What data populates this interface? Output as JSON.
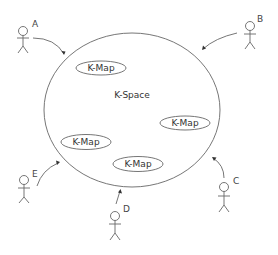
{
  "diagram": {
    "space": {
      "label": "K-Space",
      "cx": 132,
      "cy": 110,
      "rx": 88,
      "ry": 77
    },
    "maps": [
      {
        "label": "K-Map",
        "cx": 101,
        "cy": 68,
        "rx": 25,
        "ry": 7
      },
      {
        "label": "K-Map",
        "cx": 185,
        "cy": 123,
        "rx": 25,
        "ry": 7
      },
      {
        "label": "K-Map",
        "cx": 86,
        "cy": 142,
        "rx": 25,
        "ry": 7.5
      },
      {
        "label": "K-Map",
        "cx": 138,
        "cy": 164,
        "rx": 25,
        "ry": 7.5
      }
    ],
    "actors": [
      {
        "id": "A",
        "label": "A"
      },
      {
        "id": "B",
        "label": "B"
      },
      {
        "id": "C",
        "label": "C"
      },
      {
        "id": "D",
        "label": "D"
      },
      {
        "id": "E",
        "label": "E"
      }
    ]
  }
}
